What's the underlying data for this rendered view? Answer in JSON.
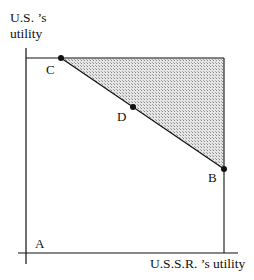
{
  "diagram": {
    "y_axis_label_line1": "U.S. ’s",
    "y_axis_label_line2": "utility",
    "x_axis_label": "U.S.S.R. ’s utility",
    "points": {
      "A": "A",
      "B": "B",
      "C": "C",
      "D": "D"
    },
    "colors": {
      "line": "#111111",
      "shade": "#c8c8c8"
    }
  }
}
